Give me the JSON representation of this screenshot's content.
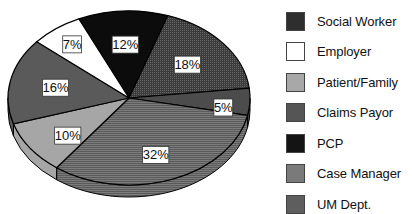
{
  "chart_data": {
    "type": "pie",
    "title": "",
    "style": "3d-pie",
    "categories": [
      "PCP",
      "Social Worker",
      "Claims Payor",
      "UM Dept.",
      "Patient/Family",
      "Case Manager",
      "Employer"
    ],
    "values": [
      12,
      18,
      5,
      32,
      10,
      16,
      7
    ],
    "labels": [
      "12%",
      "18%",
      "5%",
      "32%",
      "10%",
      "16%",
      "7%"
    ],
    "legend": {
      "position": "right",
      "entries": [
        "Social Worker",
        "Employer",
        "Patient/Family",
        "Claims Payor",
        "PCP",
        "Case Manager",
        "UM Dept."
      ]
    }
  },
  "slices": [
    {
      "name": "PCP",
      "value": 12,
      "label": "12%",
      "color": "#0c0c0c",
      "side": "#000000"
    },
    {
      "name": "Social Worker",
      "value": 18,
      "label": "18%",
      "color": "#3a3a3a",
      "side": "#2a2a2a"
    },
    {
      "name": "Claims Payor",
      "value": 5,
      "label": "5%",
      "color": "#4c4c4c",
      "side": "#3a3a3a"
    },
    {
      "name": "UM Dept.",
      "value": 32,
      "label": "32%",
      "color": "#686868",
      "side": "#555555"
    },
    {
      "name": "Patient/Family",
      "value": 10,
      "label": "10%",
      "color": "#a6a6a6",
      "side": "#8a8a8a"
    },
    {
      "name": "Case Manager",
      "value": 16,
      "label": "16%",
      "color": "#5a5a5a",
      "side": "#464646"
    },
    {
      "name": "Employer",
      "value": 7,
      "label": "7%",
      "color": "#ffffff",
      "side": "#dddddd"
    }
  ],
  "legend": [
    {
      "label": "Social Worker",
      "color": "#2e2e2e"
    },
    {
      "label": "Employer",
      "color": "#ffffff"
    },
    {
      "label": "Patient/Family",
      "color": "#a8a8a8"
    },
    {
      "label": "Claims Payor",
      "color": "#555555"
    },
    {
      "label": "PCP",
      "color": "#141414"
    },
    {
      "label": "Case Manager",
      "color": "#7a7a7a"
    },
    {
      "label": "UM Dept.",
      "color": "#5e5e5e"
    }
  ]
}
